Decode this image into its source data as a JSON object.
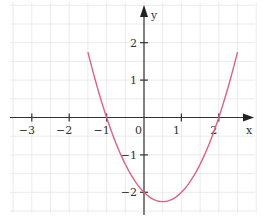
{
  "chart_data": {
    "type": "line",
    "title": "",
    "xlabel": "x",
    "ylabel": "y",
    "function": "y = x^2 - x - 2",
    "x_ticks": [
      "−3",
      "−2",
      "−1",
      "0",
      "1",
      "2"
    ],
    "y_ticks": [
      "2",
      "1",
      "−1",
      "−2"
    ],
    "xlim": [
      -3.6,
      2.9
    ],
    "ylim": [
      -2.6,
      3.1
    ],
    "grid": true,
    "grid_step": 0.5,
    "series": [
      {
        "name": "parabola",
        "color": "#e0607e",
        "x": [
          -1.5,
          -1.25,
          -1,
          -0.75,
          -0.5,
          -0.25,
          0,
          0.25,
          0.5,
          0.75,
          1,
          1.25,
          1.5,
          1.75,
          2,
          2.25,
          2.5
        ],
        "y": [
          1.75,
          0.8125,
          0,
          -0.6875,
          -1.25,
          -1.6875,
          -2,
          -2.1875,
          -2.25,
          -2.1875,
          -2,
          -1.6875,
          -1.25,
          -0.6875,
          0,
          0.8125,
          1.75
        ]
      }
    ],
    "roots": [
      -1,
      2
    ],
    "y_intercept": -2,
    "vertex": [
      0.5,
      -2.25
    ]
  },
  "colors": {
    "grid": "#e6e6e6",
    "axis": "#333333",
    "curve": "#e0607e"
  }
}
